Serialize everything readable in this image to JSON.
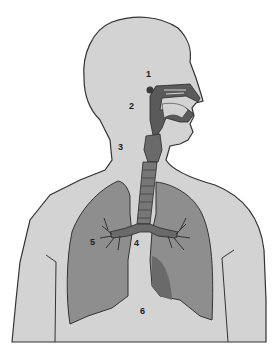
{
  "diagram": {
    "colors": {
      "background": "#ffffff",
      "body_fill": "#d3d3d3",
      "outline": "#333333",
      "lung_fill": "#8e8e8e",
      "lung_shadow": "#6a6a6a",
      "airway_fill": "#5a5a5a"
    },
    "labels": [
      {
        "id": "1",
        "text": "1",
        "x": 146,
        "y": 72
      },
      {
        "id": "2",
        "text": "2",
        "x": 130,
        "y": 104
      },
      {
        "id": "3",
        "text": "3",
        "x": 119,
        "y": 145
      },
      {
        "id": "4",
        "text": "4",
        "x": 134,
        "y": 241
      },
      {
        "id": "5",
        "text": "5",
        "x": 91,
        "y": 240
      },
      {
        "id": "6",
        "text": "6",
        "x": 140,
        "y": 309
      }
    ]
  }
}
